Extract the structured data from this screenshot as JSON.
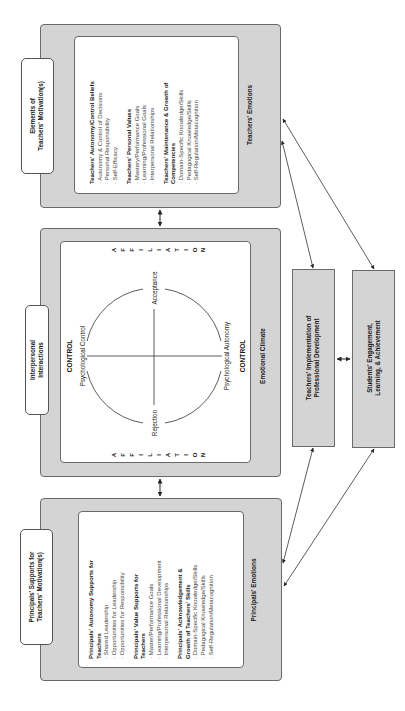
{
  "figure": {
    "teacher_motivation": {
      "tab_label_line1": "Elements of",
      "tab_label_line2": "Teachers' Motivation(s)",
      "sections": [
        {
          "heading": "Teachers' Autonomy/Control Beliefs",
          "items": [
            "· Autonomy & Control of Decisions",
            "· Personal Responsibility",
            "· Self-Efficacy"
          ]
        },
        {
          "heading": "Teachers' Personal Values",
          "items": [
            "· Mastery/Performance Goals",
            "· Learning/Professional Goals",
            "· Interpersonal Relationships"
          ]
        },
        {
          "heading": "Teachers' Maintenance & Growth of",
          "heading2": "Competencies",
          "items": [
            "· Domain-Specific Knowledge/Skills",
            "· Pedagogical Knowledge/Skills",
            "· Self-Regulation/Metacognition"
          ]
        }
      ],
      "caption": "Teachers' Emotions"
    },
    "interpersonal": {
      "tab_label_line1": "Interpersonal",
      "tab_label_line2": "Interactions",
      "affiliation_letters": [
        "A",
        "F",
        "F",
        "I",
        "L",
        "I",
        "A",
        "T",
        "I",
        "O",
        "N"
      ],
      "control_label": "CONTROL",
      "psych_control": "Psychological Control",
      "psych_autonomy": "Psychological Autonomy",
      "acceptance": "Acceptance",
      "rejection": "Rejection",
      "caption": "Emotional Climate"
    },
    "principal_supports": {
      "tab_label_line1": "Principals' Supports for",
      "tab_label_line2": "Teachers' Motivation(s)",
      "sections": [
        {
          "heading": "Principals' Autonomy Supports for",
          "heading2": "Teachers",
          "items": [
            "· Shared Leadership",
            "· Opportunities for Leadership",
            "· Opportunities for Responsibility"
          ]
        },
        {
          "heading": "Principals' Value Supports for",
          "heading2": "Teachers",
          "items": [
            "· Master/Performance Goals",
            "· Learning/Professional Development",
            "· Interpersonal Relationships"
          ]
        },
        {
          "heading": "Principals' Acknowledgement &",
          "heading2": "Growth of Teachers' Skills",
          "items": [
            "· Domain-Specific Knowledge/Skills",
            "· Pedagogical Knowledge/Skills",
            "· Self-Regulation/Metacognition"
          ]
        }
      ],
      "caption": "Principals' Emotions"
    },
    "outcomes": {
      "implementation_line1": "Teachers' Implementation of",
      "implementation_line2": "Professional Development",
      "students_line1": "Students' Engagement,",
      "students_line2": "Learning, & Achievement"
    }
  }
}
